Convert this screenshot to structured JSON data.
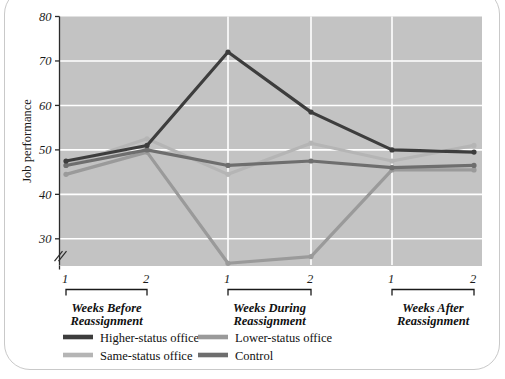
{
  "chart_data": {
    "type": "line",
    "title": "",
    "subtitle": "",
    "xlabel": "",
    "ylabel": "Job performance",
    "ylim": [
      24,
      80
    ],
    "yticks": [
      30,
      40,
      50,
      60,
      70,
      80
    ],
    "ytick_labels": [
      "30",
      "40",
      "50",
      "60",
      "70",
      "80"
    ],
    "y_axis_break": true,
    "grid": true,
    "grid_color": "#ffffff",
    "plot_background": "#c3c3c3",
    "legend_position": "below-axis",
    "x": [
      1,
      2,
      3,
      4,
      5,
      6
    ],
    "xtick_labels": [
      "1",
      "2",
      "1",
      "2",
      "1",
      "2"
    ],
    "x_groups": [
      {
        "label_line1": "Weeks Before",
        "label_line2": "Reassignment",
        "ticks": [
          "1",
          "2"
        ]
      },
      {
        "label_line1": "Weeks During",
        "label_line2": "Reassignment",
        "ticks": [
          "1",
          "2"
        ]
      },
      {
        "label_line1": "Weeks After",
        "label_line2": "Reassignment",
        "ticks": [
          "1",
          "2"
        ]
      }
    ],
    "series": [
      {
        "name": "Higher-status office",
        "color": "#3d3d3d",
        "values": [
          47.5,
          51.0,
          72.0,
          58.5,
          50.0,
          49.5
        ]
      },
      {
        "name": "Lower-status office",
        "color": "#9a9a9a",
        "values": [
          44.5,
          49.5,
          24.5,
          26.0,
          45.5,
          45.5
        ]
      },
      {
        "name": "Same-status office",
        "color": "#b5b5b5",
        "values": [
          46.5,
          52.5,
          44.5,
          51.5,
          47.5,
          51.0
        ]
      },
      {
        "name": "Control",
        "color": "#6e6e6e",
        "values": [
          46.5,
          50.0,
          46.5,
          47.5,
          46.0,
          46.5
        ]
      }
    ]
  },
  "legend": {
    "items": [
      {
        "label": "Higher-status office",
        "color": "#3d3d3d"
      },
      {
        "label": "Lower-status office",
        "color": "#9a9a9a"
      },
      {
        "label": "Same-status office",
        "color": "#b5b5b5"
      },
      {
        "label": "Control",
        "color": "#6e6e6e"
      }
    ]
  },
  "axes": {
    "y_title": "Job performance"
  }
}
